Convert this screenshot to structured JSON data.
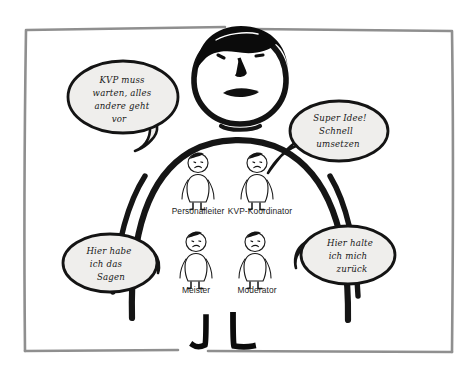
{
  "illustration": {
    "title": "KVP Rollen Karikatur",
    "background_color": "#ffffff",
    "frame": {
      "name": "hand-drawn-frame",
      "color": "#8c8c8c"
    },
    "big_figure": {
      "name": "big-manager-figure",
      "stroke_color": "#121212",
      "hair_color": "#0a0a0a",
      "expression": "frowning"
    },
    "speech_bubbles": [
      {
        "id": "bubble-top-left",
        "lines": [
          "KVP muss",
          "warten, alles",
          "andere geht",
          "vor"
        ],
        "fill": "#efeeec",
        "stroke": "#141414"
      },
      {
        "id": "bubble-top-right",
        "lines": [
          "Super Idee!",
          "Schnell",
          "umsetzen"
        ],
        "fill": "#efeeec",
        "stroke": "#141414"
      },
      {
        "id": "bubble-bottom-left",
        "lines": [
          "Hier habe",
          "ich das",
          "Sagen"
        ],
        "fill": "#efeeec",
        "stroke": "#141414"
      },
      {
        "id": "bubble-bottom-right",
        "lines": [
          "Hier halte",
          "ich mich",
          "zurück"
        ],
        "fill": "#efeeec",
        "stroke": "#141414"
      }
    ],
    "small_figures": [
      {
        "id": "figure-personalleiter",
        "label": "Personalleiter"
      },
      {
        "id": "figure-kvp-koordinator",
        "label": "KVP-Koordinator"
      },
      {
        "id": "figure-meister",
        "label": "Meister"
      },
      {
        "id": "figure-moderator",
        "label": "Moderator"
      }
    ]
  }
}
